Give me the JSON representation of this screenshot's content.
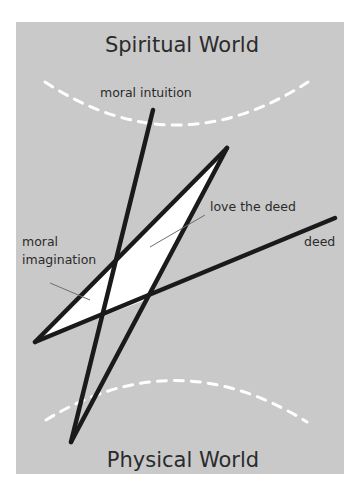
{
  "diagram": {
    "colors": {
      "background": "#ffffff",
      "panel": "#c9c9c9",
      "lines": "#1a1a1a",
      "fill": "#ffffff",
      "arc": "#ffffff",
      "leader": "#6e6e6e",
      "text": "#2b2b2b"
    },
    "titles": {
      "top": "Spiritual World",
      "bottom": "Physical World"
    },
    "labels": {
      "moral_intuition": "moral intuition",
      "love_the_deed": "love the deed",
      "deed": "deed",
      "moral_imagination_line1": "moral",
      "moral_imagination_line2": "imagination"
    }
  }
}
